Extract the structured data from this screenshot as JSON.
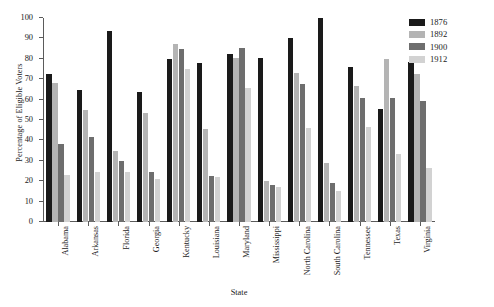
{
  "chart_data": {
    "type": "bar",
    "title": "",
    "xlabel": "State",
    "ylabel": "Percentage of Eligible Voters",
    "ylim": [
      0,
      100
    ],
    "yticks": [
      0,
      10,
      20,
      30,
      40,
      50,
      60,
      70,
      80,
      90,
      100
    ],
    "grid": false,
    "legend_position": "top-right",
    "categories": [
      "Alabama",
      "Arkansas",
      "Florida",
      "Georgia",
      "Kentucky",
      "Louisiana",
      "Maryland",
      "Mississippi",
      "North Carolina",
      "South Carolina",
      "Tennessee",
      "Texas",
      "Virginia"
    ],
    "series": [
      {
        "name": "1876",
        "color": "#1a1a1a",
        "values": [
          72.5,
          64.5,
          93.5,
          63.5,
          80.0,
          78.0,
          82.5,
          80.5,
          90.0,
          100.0,
          76.0,
          55.5,
          78.5
        ]
      },
      {
        "name": "1892",
        "color": "#b4b4b4",
        "values": [
          68.0,
          55.0,
          35.0,
          53.5,
          87.5,
          45.5,
          80.5,
          20.0,
          73.0,
          29.0,
          66.5,
          80.0,
          72.5
        ]
      },
      {
        "name": "1900",
        "color": "#6e6e6e",
        "values": [
          38.0,
          41.5,
          30.0,
          24.5,
          85.0,
          22.5,
          85.5,
          18.0,
          67.5,
          19.0,
          61.0,
          61.0,
          59.5
        ]
      },
      {
        "name": "1912",
        "color": "#d2d2d2",
        "values": [
          23.0,
          24.5,
          24.5,
          21.0,
          75.0,
          22.0,
          65.5,
          17.0,
          46.0,
          15.0,
          46.5,
          33.5,
          26.5
        ]
      }
    ]
  },
  "legend": {
    "items": [
      {
        "label": "1876",
        "color": "#1a1a1a"
      },
      {
        "label": "1892",
        "color": "#b4b4b4"
      },
      {
        "label": "1900",
        "color": "#6e6e6e"
      },
      {
        "label": "1912",
        "color": "#d2d2d2"
      }
    ]
  },
  "caption": ""
}
